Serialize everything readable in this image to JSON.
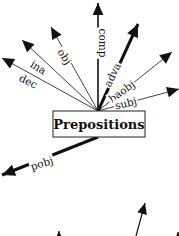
{
  "diagram": {
    "center": {
      "label": "Prepositions",
      "box": {
        "x": 53,
        "y": 111,
        "w": 92,
        "h": 26
      }
    },
    "hub": {
      "x": 98,
      "y": 111
    },
    "edges": [
      {
        "label": "dec",
        "x2": 2,
        "y2": 58,
        "label_x": 28,
        "label_y": 82,
        "angle": 26,
        "weight": "thin"
      },
      {
        "label": "ina",
        "x2": 22,
        "y2": 40,
        "label_x": 38,
        "label_y": 68,
        "angle": 32,
        "weight": "thin"
      },
      {
        "label": "obj",
        "x2": 51,
        "y2": 27,
        "label_x": 64,
        "label_y": 57,
        "angle": 57,
        "weight": "thin"
      },
      {
        "label": "comp",
        "x2": 98,
        "y2": 3,
        "label_x": 102,
        "label_y": 43,
        "angle": 90,
        "weight": "medium"
      },
      {
        "label": "adva",
        "x2": 138,
        "y2": 24,
        "label_x": 113,
        "label_y": 75,
        "angle": -64,
        "weight": "thick"
      },
      {
        "label": "baobj",
        "x2": 172,
        "y2": 52,
        "label_x": 122,
        "label_y": 92,
        "angle": -36,
        "weight": "thin"
      },
      {
        "label": "subj",
        "x2": 179,
        "y2": 89,
        "label_x": 126,
        "label_y": 104,
        "angle": -14,
        "weight": "thin"
      },
      {
        "label": "pobj",
        "x2": 2,
        "y2": 175,
        "label_x": 42,
        "label_y": 164,
        "angle": -18,
        "weight": "thick",
        "from_bottom": true
      }
    ],
    "partial_edges_bottom": [
      {
        "x1": 136,
        "y1": 236,
        "x2": 145,
        "y2": 203
      },
      {
        "x1": 59,
        "y1": 236,
        "x2": 59,
        "y2": 231
      },
      {
        "x1": 178,
        "y1": 236,
        "x2": 178,
        "y2": 232
      }
    ],
    "colors": {
      "ink": "#111111",
      "background": "#ffffff"
    }
  }
}
